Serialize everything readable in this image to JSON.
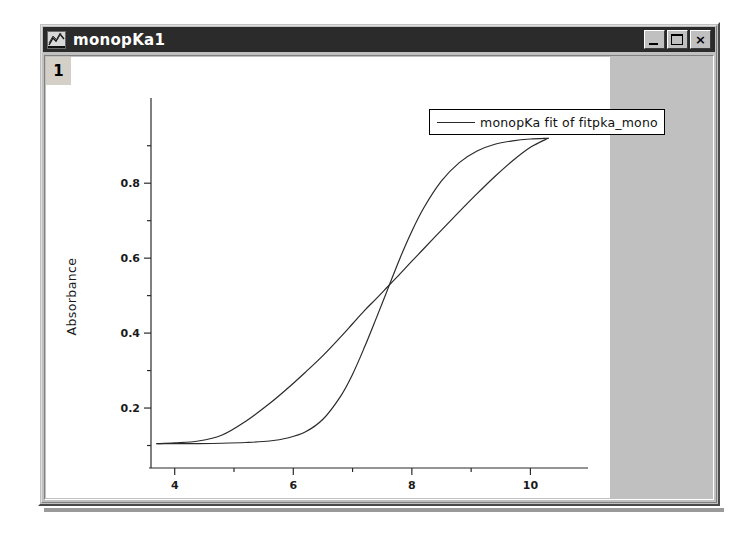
{
  "window": {
    "title": "monopKa1",
    "icon": "chart-window-icon",
    "controls": [
      {
        "name": "minimize",
        "label": "_"
      },
      {
        "name": "maximize",
        "label": "□"
      },
      {
        "name": "close",
        "label": "×"
      }
    ]
  },
  "plot": {
    "layer_label": "1",
    "legend": {
      "label": "monopKa fit of fitpka_mono",
      "line_color": "#2a2a2a"
    }
  },
  "chart_data": {
    "type": "line",
    "title": "",
    "xlabel": "pH Buffer Values",
    "ylabel": "Absorbance",
    "xlim": [
      3.6,
      10.6
    ],
    "ylim": [
      0.04,
      0.99
    ],
    "xticks": [
      4,
      6,
      8,
      10
    ],
    "xticks_minor": [
      5,
      7,
      9
    ],
    "yticks": [
      0.2,
      0.4,
      0.6,
      0.8
    ],
    "yticks_minor": [
      0.1,
      0.3,
      0.5,
      0.7,
      0.9
    ],
    "grid": false,
    "legend_position": "top-right",
    "line_color": "#2a2a2a",
    "series": [
      {
        "name": "monopKa fit of fitpka_mono",
        "style": "sigmoid-steep",
        "x": [
          3.7,
          4.0,
          4.4,
          4.8,
          5.2,
          5.6,
          5.9,
          6.2,
          6.5,
          6.8,
          7.0,
          7.2,
          7.4,
          7.6,
          7.8,
          8.0,
          8.2,
          8.5,
          8.8,
          9.1,
          9.4,
          9.7,
          10.0,
          10.3
        ],
        "y": [
          0.105,
          0.105,
          0.105,
          0.106,
          0.108,
          0.112,
          0.12,
          0.136,
          0.17,
          0.232,
          0.29,
          0.362,
          0.44,
          0.52,
          0.6,
          0.672,
          0.734,
          0.806,
          0.855,
          0.886,
          0.904,
          0.913,
          0.918,
          0.92
        ]
      },
      {
        "name": "monopKa fit of fitpka_mono",
        "style": "sigmoid-broad",
        "x": [
          3.7,
          4.0,
          4.4,
          4.8,
          5.2,
          5.6,
          5.9,
          6.2,
          6.5,
          6.8,
          7.0,
          7.2,
          7.4,
          7.6,
          7.8,
          8.0,
          8.2,
          8.5,
          8.8,
          9.1,
          9.4,
          9.7,
          10.0,
          10.3
        ],
        "y": [
          0.105,
          0.107,
          0.112,
          0.128,
          0.165,
          0.212,
          0.252,
          0.295,
          0.34,
          0.39,
          0.425,
          0.46,
          0.492,
          0.525,
          0.558,
          0.592,
          0.625,
          0.675,
          0.724,
          0.772,
          0.818,
          0.86,
          0.896,
          0.92
        ]
      }
    ]
  }
}
